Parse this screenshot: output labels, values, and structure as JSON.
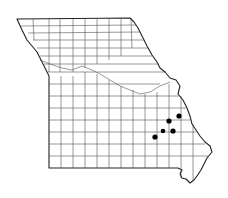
{
  "map": {
    "region": "Missouri",
    "subdivision": "counties",
    "background": "#ffffff",
    "line_color": "#333333",
    "marker_color": "#000000",
    "markers": [
      {
        "x": 179,
        "y": 116,
        "r": 2.6
      },
      {
        "x": 169,
        "y": 121,
        "r": 2.6
      },
      {
        "x": 173,
        "y": 131,
        "r": 2.6
      },
      {
        "x": 163,
        "y": 131,
        "r": 2.3
      },
      {
        "x": 155,
        "y": 137,
        "r": 2.6
      }
    ]
  }
}
